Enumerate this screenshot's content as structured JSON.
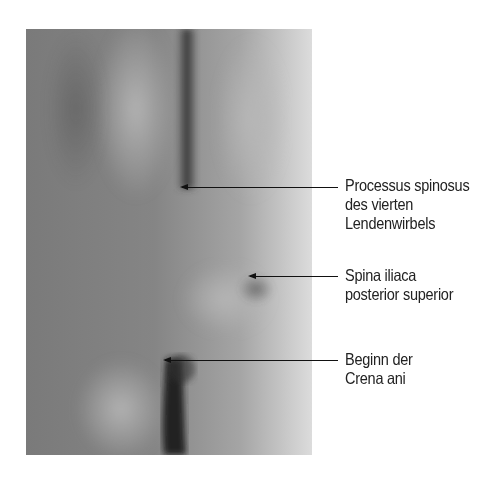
{
  "figure": {
    "type": "anatomical surface photograph"
  },
  "labels": [
    {
      "id": "processus-spinosus",
      "lines": [
        "Processus spinosus",
        "des vierten",
        "Lendenwirbels"
      ]
    },
    {
      "id": "spina-iliaca",
      "lines": [
        "Spina iliaca",
        "posterior superior"
      ]
    },
    {
      "id": "crena-ani",
      "lines": [
        "Beginn der",
        "Crena ani"
      ]
    }
  ],
  "colors": {
    "background": "#ffffff",
    "leader_line": "#111111",
    "text": "#222222"
  }
}
